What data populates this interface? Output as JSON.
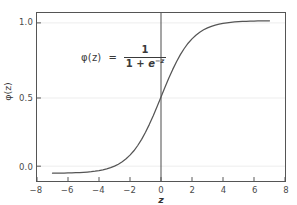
{
  "chart_data": {
    "type": "line",
    "title": "",
    "xlabel": "z",
    "ylabel": "φ(z)",
    "xlim": [
      -8,
      8
    ],
    "ylim": [
      -0.05,
      1.05
    ],
    "grid": true,
    "legend": null,
    "annotation": {
      "lhs": "φ(z)",
      "equals": "=",
      "numerator": "1",
      "denominator_prefix": "1 + ",
      "denominator_base": "e",
      "denominator_exponent": "−z",
      "full_text": "φ(z) = 1 / (1 + e^(−z))"
    },
    "xticks": [
      -8,
      -6,
      -4,
      -2,
      0,
      2,
      4,
      6,
      8
    ],
    "xtick_labels": [
      "−8",
      "−6",
      "−4",
      "−2",
      "0",
      "2",
      "4",
      "6",
      "8"
    ],
    "yticks": [
      0.0,
      0.5,
      1.0
    ],
    "ytick_labels": [
      "0.0",
      "0.5",
      "1.0"
    ],
    "gridlines_y": [
      0.0,
      0.5,
      1.0
    ],
    "vline_x": 0,
    "series": [
      {
        "name": "sigmoid",
        "color": "#555555",
        "linewidth": 1.2,
        "x": [
          -7.0,
          -6.75,
          -6.5,
          -6.25,
          -6.0,
          -5.75,
          -5.5,
          -5.25,
          -5.0,
          -4.75,
          -4.5,
          -4.25,
          -4.0,
          -3.75,
          -3.5,
          -3.25,
          -3.0,
          -2.75,
          -2.5,
          -2.25,
          -2.0,
          -1.75,
          -1.5,
          -1.25,
          -1.0,
          -0.75,
          -0.5,
          -0.25,
          0.0,
          0.25,
          0.5,
          0.75,
          1.0,
          1.25,
          1.5,
          1.75,
          2.0,
          2.25,
          2.5,
          2.75,
          3.0,
          3.25,
          3.5,
          3.75,
          4.0,
          4.25,
          4.5,
          4.75,
          5.0,
          5.25,
          5.5,
          5.75,
          6.0,
          6.25,
          6.5,
          6.75,
          7.0
        ],
        "y": [
          0.0009,
          0.0012,
          0.0015,
          0.0019,
          0.0025,
          0.0032,
          0.0041,
          0.0052,
          0.0067,
          0.0086,
          0.011,
          0.014,
          0.018,
          0.023,
          0.0293,
          0.0373,
          0.0474,
          0.0601,
          0.0759,
          0.0953,
          0.1192,
          0.148,
          0.1824,
          0.2227,
          0.2689,
          0.3208,
          0.3775,
          0.4378,
          0.5,
          0.5622,
          0.6225,
          0.6792,
          0.7311,
          0.7773,
          0.8176,
          0.852,
          0.8808,
          0.9045,
          0.9241,
          0.9399,
          0.9526,
          0.9627,
          0.9707,
          0.977,
          0.982,
          0.986,
          0.989,
          0.9914,
          0.9933,
          0.9948,
          0.9959,
          0.9968,
          0.9975,
          0.9981,
          0.9985,
          0.9988,
          0.9991
        ]
      }
    ],
    "colors": {
      "background": "#ffffff",
      "curve": "#555555",
      "axis_spine": "#555555",
      "grid": "#e8e8e8",
      "vline": "#444444",
      "tick_text": "#4a4a4a",
      "label_text": "#333333"
    }
  }
}
